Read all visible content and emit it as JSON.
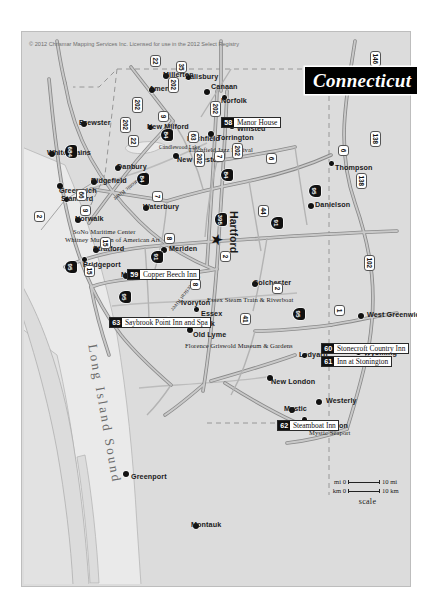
{
  "document": {
    "title": "Connecticut",
    "credit": "© 2012 Chrismar Mapping Services Inc. Licensed for use in the 2012 Select Registry",
    "orientation": "map rotated 90 degrees clockwise on portrait page"
  },
  "scale": {
    "caption": "scale",
    "mi_start": "mi 0",
    "mi_end": "10 mi",
    "km_start": "km 0",
    "km_end": "10 km"
  },
  "water_labels": [
    {
      "text": "Long Island Sound"
    }
  ],
  "inns": [
    {
      "number": "58",
      "name": "Manor House"
    },
    {
      "number": "59",
      "name": "Copper Beech Inn"
    },
    {
      "number": "60",
      "name": "Stonecroft Country Inn"
    },
    {
      "number": "61",
      "name": "Inn at Stonington"
    },
    {
      "number": "62",
      "name": "Steamboat Inn"
    },
    {
      "number": "63",
      "name": "Saybrook Point Inn and Spa"
    }
  ],
  "cities": [
    {
      "name": "Thompson"
    },
    {
      "name": "Danielson"
    },
    {
      "name": "West Greenwich"
    },
    {
      "name": "Wyoming"
    },
    {
      "name": "Westerly"
    },
    {
      "name": "Stonington"
    },
    {
      "name": "Mystic"
    },
    {
      "name": "Mystic Seaport"
    },
    {
      "name": "Ledyard"
    },
    {
      "name": "New London"
    },
    {
      "name": "Colchester"
    },
    {
      "name": "Essex"
    },
    {
      "name": "Old Lyme"
    },
    {
      "name": "Ivoryton"
    },
    {
      "name": "Old Saybrook"
    },
    {
      "name": "New Haven"
    },
    {
      "name": "Meriden"
    },
    {
      "name": "Hartford"
    },
    {
      "name": "Winsted"
    },
    {
      "name": "Torrington"
    },
    {
      "name": "Litchfield"
    },
    {
      "name": "Norfolk"
    },
    {
      "name": "Canaan"
    },
    {
      "name": "Salisbury"
    },
    {
      "name": "Millerton"
    },
    {
      "name": "Amenia"
    },
    {
      "name": "New Preston"
    },
    {
      "name": "New Milford"
    },
    {
      "name": "Waterbury"
    },
    {
      "name": "Danbury"
    },
    {
      "name": "Ridgefield"
    },
    {
      "name": "Stratford"
    },
    {
      "name": "Bridgeport"
    },
    {
      "name": "Norwalk"
    },
    {
      "name": "Stamford"
    },
    {
      "name": "Greenwich"
    },
    {
      "name": "White Plains"
    },
    {
      "name": "Greenport"
    },
    {
      "name": "Montauk"
    },
    {
      "name": "Brewster"
    },
    {
      "name": "Candlewood Lake"
    },
    {
      "name": "Connecticut River"
    },
    {
      "name": "Housatonic River"
    }
  ],
  "points_of_interest": [
    {
      "name": "Essex Steam Train & Riverboat"
    },
    {
      "name": "Florence Griswold Museum & Gardens"
    },
    {
      "name": "Litchfield Jazz Festival"
    },
    {
      "name": "SoNo Maritime Center"
    },
    {
      "name": "Whitney Museum of American Art"
    }
  ],
  "routes": {
    "interstate": [
      "84",
      "91",
      "95",
      "395",
      "291",
      "684"
    ],
    "us_state": [
      "1",
      "2",
      "6",
      "7",
      "8",
      "9",
      "11",
      "15",
      "22",
      "35",
      "41",
      "44",
      "66",
      "102",
      "138",
      "146",
      "202"
    ]
  },
  "colors": {
    "land": "#dcdcdc",
    "water": "#eaeaea",
    "road": "#9a9a9a",
    "highway": "#8c8c8c",
    "marker": "#111111",
    "title_bg": "#000000",
    "title_fg": "#ffffff"
  }
}
